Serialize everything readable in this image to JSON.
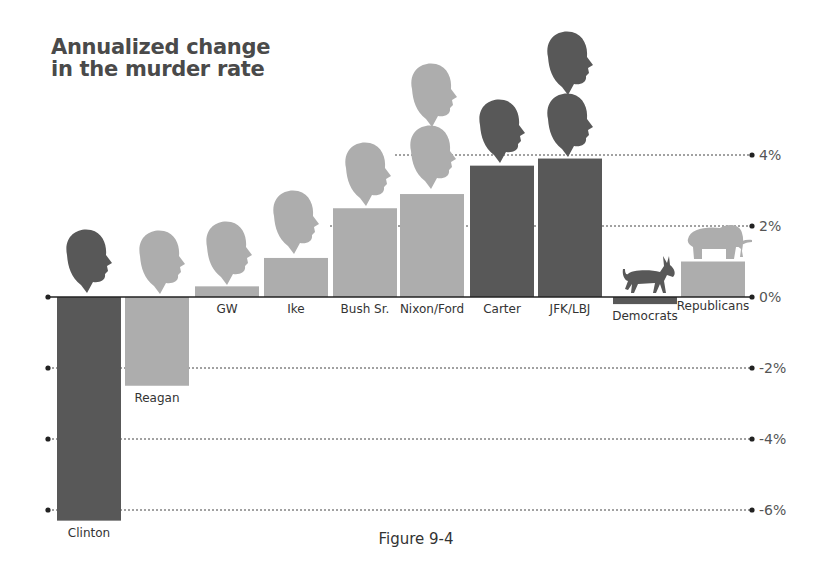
{
  "title_lines": [
    "Annualized change",
    "in the murder rate"
  ],
  "caption": "Figure 9-4",
  "colors": {
    "dark": "#585858",
    "light": "#adadad",
    "axis": "#222222",
    "grid": "#444444",
    "text": "#333333"
  },
  "chart_data": {
    "type": "bar",
    "title": "Annualized change in the murder rate",
    "xlabel": "",
    "ylabel": "",
    "ylim": [
      -6.5,
      4.5
    ],
    "y_ticks": [
      4,
      2,
      0,
      -2,
      -4,
      -6
    ],
    "y_tick_labels": [
      "4%",
      "2%",
      "0%",
      "-2%",
      "-4%",
      "-6%"
    ],
    "grid": "dotted horizontal",
    "categories": [
      "Clinton",
      "Reagan",
      "GW",
      "Ike",
      "Bush Sr.",
      "Nixon/Ford",
      "Carter",
      "JFK/LBJ",
      "Democrats",
      "Republicans"
    ],
    "values": [
      -6.3,
      -2.5,
      0.3,
      1.1,
      2.5,
      2.9,
      3.7,
      3.9,
      -0.2,
      1.0
    ],
    "party": [
      "D",
      "R",
      "R",
      "R",
      "R",
      "R",
      "D",
      "D",
      "D",
      "R"
    ],
    "icons": [
      "head",
      "head",
      "head",
      "head",
      "head",
      "two-heads",
      "head",
      "two-heads",
      "donkey",
      "elephant"
    ]
  }
}
